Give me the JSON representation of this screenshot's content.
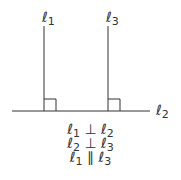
{
  "diagram": {
    "title": "",
    "lines": [
      {
        "id": "l1",
        "symbol": "ℓ",
        "subscript": "1",
        "orientation": "vertical"
      },
      {
        "id": "l3",
        "symbol": "ℓ",
        "subscript": "3",
        "orientation": "vertical"
      },
      {
        "id": "l2",
        "symbol": "ℓ",
        "subscript": "2",
        "orientation": "horizontal"
      }
    ],
    "relations": [
      {
        "a": "ℓ",
        "a_sub": "1",
        "op": "⊥",
        "b": "ℓ",
        "b_sub": "2"
      },
      {
        "a": "ℓ",
        "a_sub": "2",
        "op": "⊥",
        "b": "ℓ",
        "b_sub": "3"
      },
      {
        "a": "ℓ",
        "a_sub": "1",
        "op": "∥",
        "b": "ℓ",
        "b_sub": "3"
      }
    ],
    "stroke_color": "#333333"
  }
}
